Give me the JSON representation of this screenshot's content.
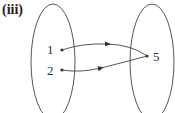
{
  "label": "(iii)",
  "domain_set": {
    "elements": [
      "1",
      "2"
    ]
  },
  "codomain_set": {
    "elements": [
      "5"
    ]
  },
  "mappings": [
    {
      "from": "1",
      "to": "5"
    },
    {
      "from": "2",
      "to": "5"
    }
  ],
  "colors": {
    "stroke": "#444444",
    "text": "#333333"
  }
}
